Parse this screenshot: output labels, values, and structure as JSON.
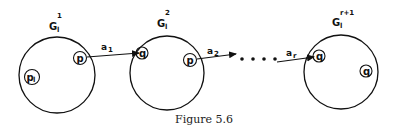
{
  "figure": {
    "caption": "Figure 5.6",
    "graphs": [
      {
        "name": "G",
        "sub": "l",
        "sup": "1",
        "nodes": [
          {
            "label": "p"
          },
          {
            "label": "p",
            "sub": "l"
          }
        ]
      },
      {
        "name": "G",
        "sub": "l",
        "sup": "2",
        "nodes": [
          {
            "label": "q"
          },
          {
            "label": "p"
          }
        ]
      },
      {
        "name": "G",
        "sub": "l",
        "sup": "r+1",
        "nodes": [
          {
            "label": "q"
          },
          {
            "label": "q"
          }
        ]
      }
    ],
    "edges": [
      {
        "label": "a",
        "sub": "1"
      },
      {
        "label": "a",
        "sub": "2"
      },
      {
        "label": "a",
        "sub": "r"
      }
    ],
    "ellipsis": "• • • •",
    "colors": {
      "stroke": "#111111",
      "background": "#ffffff"
    }
  }
}
